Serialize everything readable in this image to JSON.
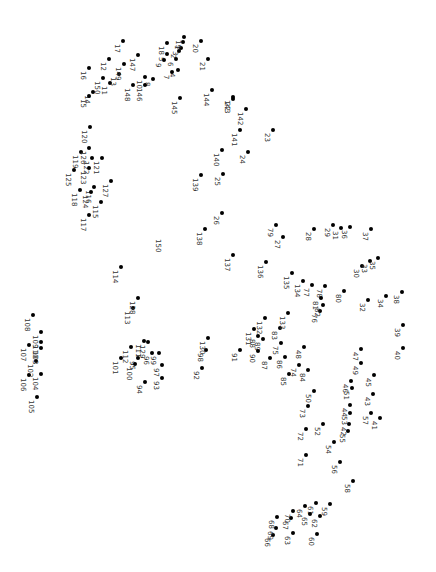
{
  "puzzle": {
    "type": "connect-the-dots",
    "orientation": "rotated-90-clockwise",
    "dot_color": "#000000",
    "label_color": "#333333",
    "points": [
      {
        "n": "1",
        "x": 183,
        "y": 42
      },
      {
        "n": "2",
        "x": 179,
        "y": 51
      },
      {
        "n": "3",
        "x": 181,
        "y": 48
      },
      {
        "n": "4",
        "x": 178,
        "y": 70
      },
      {
        "n": "5",
        "x": 167,
        "y": 54
      },
      {
        "n": "6",
        "x": 176,
        "y": 59
      },
      {
        "n": "7",
        "x": 172,
        "y": 72
      },
      {
        "n": "8",
        "x": 153,
        "y": 79
      },
      {
        "n": "9",
        "x": 164,
        "y": 60
      },
      {
        "n": "10",
        "x": 145,
        "y": 77
      },
      {
        "n": "11",
        "x": 110,
        "y": 83
      },
      {
        "n": "12",
        "x": 109,
        "y": 59
      },
      {
        "n": "13",
        "x": 119,
        "y": 74
      },
      {
        "n": "14",
        "x": 93,
        "y": 92
      },
      {
        "n": "15",
        "x": 89,
        "y": 96
      },
      {
        "n": "16",
        "x": 89,
        "y": 68
      },
      {
        "n": "17",
        "x": 123,
        "y": 41
      },
      {
        "n": "18",
        "x": 167,
        "y": 43
      },
      {
        "n": "19",
        "x": 184,
        "y": 37
      },
      {
        "n": "20",
        "x": 201,
        "y": 41
      },
      {
        "n": "21",
        "x": 208,
        "y": 59
      },
      {
        "n": "22",
        "x": 233,
        "y": 99
      },
      {
        "n": "23",
        "x": 273,
        "y": 130
      },
      {
        "n": "24",
        "x": 248,
        "y": 152
      },
      {
        "n": "25",
        "x": 223,
        "y": 174
      },
      {
        "n": "26",
        "x": 222,
        "y": 213
      },
      {
        "n": "27",
        "x": 283,
        "y": 237
      },
      {
        "n": "28",
        "x": 314,
        "y": 229
      },
      {
        "n": "29",
        "x": 333,
        "y": 225
      },
      {
        "n": "30",
        "x": 362,
        "y": 266
      },
      {
        "n": "31",
        "x": 341,
        "y": 228
      },
      {
        "n": "32",
        "x": 368,
        "y": 300
      },
      {
        "n": "33",
        "x": 370,
        "y": 261
      },
      {
        "n": "34",
        "x": 386,
        "y": 296
      },
      {
        "n": "35",
        "x": 378,
        "y": 258
      },
      {
        "n": "36",
        "x": 350,
        "y": 227
      },
      {
        "n": "37",
        "x": 371,
        "y": 229
      },
      {
        "n": "38",
        "x": 402,
        "y": 292
      },
      {
        "n": "39",
        "x": 403,
        "y": 325
      },
      {
        "n": "40",
        "x": 403,
        "y": 348
      },
      {
        "n": "41",
        "x": 380,
        "y": 418
      },
      {
        "n": "42",
        "x": 349,
        "y": 424
      },
      {
        "n": "43",
        "x": 373,
        "y": 394
      },
      {
        "n": "44",
        "x": 350,
        "y": 405
      },
      {
        "n": "45",
        "x": 374,
        "y": 375
      },
      {
        "n": "46",
        "x": 351,
        "y": 381
      },
      {
        "n": "47",
        "x": 361,
        "y": 349
      },
      {
        "n": "48",
        "x": 304,
        "y": 347
      },
      {
        "n": "49",
        "x": 361,
        "y": 363
      },
      {
        "n": "50",
        "x": 314,
        "y": 391
      },
      {
        "n": "51",
        "x": 352,
        "y": 388
      },
      {
        "n": "52",
        "x": 323,
        "y": 424
      },
      {
        "n": "53",
        "x": 350,
        "y": 413
      },
      {
        "n": "54",
        "x": 334,
        "y": 442
      },
      {
        "n": "55",
        "x": 348,
        "y": 431
      },
      {
        "n": "56",
        "x": 340,
        "y": 462
      },
      {
        "n": "57",
        "x": 371,
        "y": 413
      },
      {
        "n": "58",
        "x": 353,
        "y": 481
      },
      {
        "n": "59",
        "x": 330,
        "y": 504
      },
      {
        "n": "60",
        "x": 317,
        "y": 534
      },
      {
        "n": "61",
        "x": 316,
        "y": 503
      },
      {
        "n": "62",
        "x": 320,
        "y": 516
      },
      {
        "n": "63",
        "x": 293,
        "y": 533
      },
      {
        "n": "64",
        "x": 305,
        "y": 506
      },
      {
        "n": "65",
        "x": 310,
        "y": 514
      },
      {
        "n": "66",
        "x": 273,
        "y": 535
      },
      {
        "n": "67",
        "x": 291,
        "y": 518
      },
      {
        "n": "68",
        "x": 277,
        "y": 517
      },
      {
        "n": "69",
        "x": 276,
        "y": 528
      },
      {
        "n": "70",
        "x": 293,
        "y": 511
      },
      {
        "n": "71",
        "x": 306,
        "y": 455
      },
      {
        "n": "72",
        "x": 306,
        "y": 429
      },
      {
        "n": "73",
        "x": 308,
        "y": 406
      },
      {
        "n": "74",
        "x": 299,
        "y": 365
      },
      {
        "n": "75",
        "x": 281,
        "y": 343
      },
      {
        "n": "76",
        "x": 320,
        "y": 311
      },
      {
        "n": "77",
        "x": 312,
        "y": 285
      },
      {
        "n": "78",
        "x": 325,
        "y": 286
      },
      {
        "n": "79",
        "x": 276,
        "y": 225
      },
      {
        "n": "80",
        "x": 344,
        "y": 291
      },
      {
        "n": "81",
        "x": 321,
        "y": 298
      },
      {
        "n": "82",
        "x": 323,
        "y": 305
      },
      {
        "n": "83",
        "x": 280,
        "y": 328
      },
      {
        "n": "84",
        "x": 308,
        "y": 370
      },
      {
        "n": "85",
        "x": 289,
        "y": 374
      },
      {
        "n": "86",
        "x": 285,
        "y": 357
      },
      {
        "n": "87",
        "x": 270,
        "y": 358
      },
      {
        "n": "88",
        "x": 258,
        "y": 336
      },
      {
        "n": "89",
        "x": 263,
        "y": 339
      },
      {
        "n": "90",
        "x": 258,
        "y": 351
      },
      {
        "n": "91",
        "x": 240,
        "y": 350
      },
      {
        "n": "92",
        "x": 202,
        "y": 368
      },
      {
        "n": "93",
        "x": 162,
        "y": 378
      },
      {
        "n": "94",
        "x": 145,
        "y": 382
      },
      {
        "n": "95",
        "x": 138,
        "y": 358
      },
      {
        "n": "96",
        "x": 152,
        "y": 353
      },
      {
        "n": "97",
        "x": 162,
        "y": 365
      },
      {
        "n": "98",
        "x": 206,
        "y": 350
      },
      {
        "n": "99",
        "x": 159,
        "y": 353
      },
      {
        "n": "100",
        "x": 135,
        "y": 364
      },
      {
        "n": "101",
        "x": 121,
        "y": 358
      },
      {
        "n": "102",
        "x": 36,
        "y": 361
      },
      {
        "n": "103",
        "x": 41,
        "y": 348
      },
      {
        "n": "104",
        "x": 41,
        "y": 374
      },
      {
        "n": "105",
        "x": 37,
        "y": 397
      },
      {
        "n": "106",
        "x": 29,
        "y": 375
      },
      {
        "n": "107",
        "x": 29,
        "y": 345
      },
      {
        "n": "108",
        "x": 33,
        "y": 315
      },
      {
        "n": "109",
        "x": 41,
        "y": 332
      },
      {
        "n": "110",
        "x": 41,
        "y": 342
      },
      {
        "n": "111",
        "x": 144,
        "y": 341
      },
      {
        "n": "112",
        "x": 131,
        "y": 347
      },
      {
        "n": "113",
        "x": 133,
        "y": 308
      },
      {
        "n": "114",
        "x": 121,
        "y": 267
      },
      {
        "n": "115",
        "x": 101,
        "y": 202
      },
      {
        "n": "116",
        "x": 94,
        "y": 187
      },
      {
        "n": "117",
        "x": 89,
        "y": 215
      },
      {
        "n": "118",
        "x": 80,
        "y": 190
      },
      {
        "n": "119",
        "x": 81,
        "y": 152
      },
      {
        "n": "120",
        "x": 90,
        "y": 127
      },
      {
        "n": "121",
        "x": 102,
        "y": 158
      },
      {
        "n": "122",
        "x": 92,
        "y": 158
      },
      {
        "n": "123",
        "x": 89,
        "y": 168
      },
      {
        "n": "124",
        "x": 91,
        "y": 192
      },
      {
        "n": "125",
        "x": 74,
        "y": 170
      },
      {
        "n": "126",
        "x": 89,
        "y": 148
      },
      {
        "n": "127",
        "x": 111,
        "y": 181
      },
      {
        "n": "128",
        "x": 138,
        "y": 298
      },
      {
        "n": "129",
        "x": 148,
        "y": 342
      },
      {
        "n": "130",
        "x": 208,
        "y": 338
      },
      {
        "n": "131",
        "x": 254,
        "y": 329
      },
      {
        "n": "132",
        "x": 265,
        "y": 318
      },
      {
        "n": "133",
        "x": 288,
        "y": 313
      },
      {
        "n": "134",
        "x": 303,
        "y": 281
      },
      {
        "n": "135",
        "x": 292,
        "y": 273
      },
      {
        "n": "136",
        "x": 266,
        "y": 262
      },
      {
        "n": "137",
        "x": 233,
        "y": 255
      },
      {
        "n": "138",
        "x": 205,
        "y": 229
      },
      {
        "n": "139",
        "x": 201,
        "y": 175
      },
      {
        "n": "140",
        "x": 222,
        "y": 150
      },
      {
        "n": "141",
        "x": 240,
        "y": 130
      },
      {
        "n": "142",
        "x": 246,
        "y": 109
      },
      {
        "n": "143",
        "x": 233,
        "y": 97
      },
      {
        "n": "144",
        "x": 212,
        "y": 90
      },
      {
        "n": "145",
        "x": 180,
        "y": 98
      },
      {
        "n": "146",
        "x": 145,
        "y": 85
      },
      {
        "n": "147",
        "x": 138,
        "y": 55
      },
      {
        "n": "148",
        "x": 133,
        "y": 85
      },
      {
        "n": "149",
        "x": 124,
        "y": 64
      },
      {
        "n": "150",
        "x": 103,
        "y": 78
      }
    ],
    "unlabeled_marker": {
      "n": "150",
      "x": 161,
      "y": 243
    }
  }
}
